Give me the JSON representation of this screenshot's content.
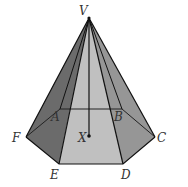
{
  "diagram": {
    "type": "hexagonal-pyramid",
    "labels": {
      "V": "V",
      "A": "A",
      "B": "B",
      "C": "C",
      "D": "D",
      "E": "E",
      "F": "F",
      "X": "X"
    },
    "colors": {
      "face_dark": "#6e6e6e",
      "face_mid": "#8c8c8c",
      "face_light": "#b4b4b4",
      "face_front": "#c2c2c2",
      "edge": "#111111"
    }
  }
}
